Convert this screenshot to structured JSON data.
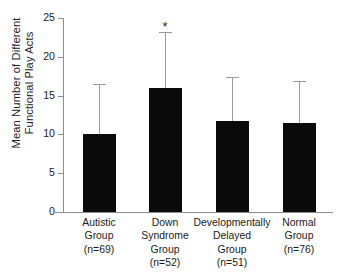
{
  "chart_data": {
    "type": "bar",
    "title": "",
    "xlabel": "",
    "ylabel_lines": [
      "Mean Number of Different",
      "Functional Play Acts"
    ],
    "ylabel": "Mean Number of Different Functional Play Acts",
    "ylim": [
      0,
      25
    ],
    "yticks": [
      0,
      5,
      10,
      15,
      20,
      25
    ],
    "ytick_labels": [
      "0",
      "5",
      "10",
      "15",
      "20",
      "25"
    ],
    "grid": false,
    "legend": false,
    "bar_color": "#0a0a0a",
    "error_color": "#9a9a9a",
    "axis_color": "#8d8d8d",
    "categories": [
      "Autistic Group (n=69)",
      "Down Syndrome Group (n=52)",
      "Developmentally Delayed Group (n=51)",
      "Normal Group (n=76)"
    ],
    "category_label_lines": [
      [
        "Autistic",
        "Group",
        "(n=69)"
      ],
      [
        "Down",
        "Syndrome",
        "Group",
        "(n=52)"
      ],
      [
        "Developmentally",
        "Delayed",
        "Group",
        "(n=51)"
      ],
      [
        "Normal",
        "Group",
        "(n=76)"
      ]
    ],
    "values": [
      10.0,
      16.0,
      11.7,
      11.5
    ],
    "error_upper": [
      16.5,
      23.2,
      17.4,
      16.9
    ],
    "error_bar_type": "upper-only standard deviation",
    "annotations": [
      {
        "text": "*",
        "category_index": 1,
        "y": 24.5,
        "meaning": "significant"
      }
    ]
  }
}
